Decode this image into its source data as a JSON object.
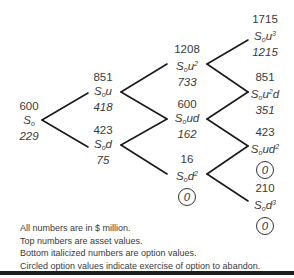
{
  "diagram": {
    "type": "binomial-tree",
    "nodes": [
      {
        "id": "n0",
        "asset": "600",
        "label_base": "S",
        "label_sub": "o",
        "label_suffix": "",
        "label_sup": "",
        "label_tail": "",
        "option": "229",
        "circled": false
      },
      {
        "id": "nu",
        "asset": "851",
        "label_base": "S",
        "label_sub": "o",
        "label_suffix": "u",
        "label_sup": "",
        "label_tail": "",
        "option": "418",
        "circled": false
      },
      {
        "id": "nd",
        "asset": "423",
        "label_base": "S",
        "label_sub": "o",
        "label_suffix": "d",
        "label_sup": "",
        "label_tail": "",
        "option": "75",
        "circled": false
      },
      {
        "id": "nuu",
        "asset": "1208",
        "label_base": "S",
        "label_sub": "o",
        "label_suffix": "u",
        "label_sup": "2",
        "label_tail": "",
        "option": "733",
        "circled": false
      },
      {
        "id": "nud",
        "asset": "600",
        "label_base": "S",
        "label_sub": "o",
        "label_suffix": "ud",
        "label_sup": "",
        "label_tail": "",
        "option": "162",
        "circled": false
      },
      {
        "id": "ndd",
        "asset": "16",
        "label_base": "S",
        "label_sub": "o",
        "label_suffix": "d",
        "label_sup": "2",
        "label_tail": "",
        "option": "0",
        "circled": true
      },
      {
        "id": "nuuu",
        "asset": "1715",
        "label_base": "S",
        "label_sub": "o",
        "label_suffix": "u",
        "label_sup": "3",
        "label_tail": "",
        "option": "1215",
        "circled": false
      },
      {
        "id": "nuud",
        "asset": "851",
        "label_base": "S",
        "label_sub": "o",
        "label_suffix": "u",
        "label_sup": "2",
        "label_tail": "d",
        "option": "351",
        "circled": false
      },
      {
        "id": "nudd",
        "asset": "423",
        "label_base": "S",
        "label_sub": "o",
        "label_suffix": "ud",
        "label_sup": "2",
        "label_tail": "",
        "option": "0",
        "circled": true
      },
      {
        "id": "nddd",
        "asset": "210",
        "label_base": "S",
        "label_sub": "o",
        "label_suffix": "d",
        "label_sup": "3",
        "label_tail": "",
        "option": "0",
        "circled": true
      }
    ],
    "edges": [
      [
        "n0",
        "nu"
      ],
      [
        "n0",
        "nd"
      ],
      [
        "nu",
        "nuu"
      ],
      [
        "nu",
        "nud"
      ],
      [
        "nd",
        "nud"
      ],
      [
        "nd",
        "ndd"
      ],
      [
        "nuu",
        "nuuu"
      ],
      [
        "nuu",
        "nuud"
      ],
      [
        "nud",
        "nuud"
      ],
      [
        "nud",
        "nudd"
      ],
      [
        "ndd",
        "nudd"
      ],
      [
        "ndd",
        "nddd"
      ]
    ]
  },
  "notes": [
    "All numbers are in $ million.",
    "Top numbers are asset values.",
    "Bottom italicized numbers are option values.",
    "Circled option values indicate exercise of option to abandon."
  ]
}
